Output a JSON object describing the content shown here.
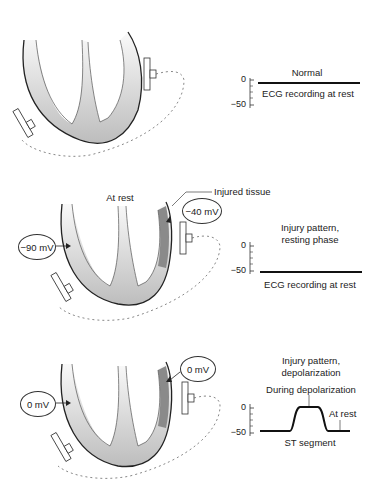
{
  "panels": [
    {
      "id": "normal",
      "heart_label": "",
      "ecg": {
        "title": "Normal",
        "caption": "ECG recording at rest",
        "axis_ticks": [
          "0",
          "−50"
        ],
        "trace": "flat-at-0"
      }
    },
    {
      "id": "injury-resting",
      "heart_label": "At rest",
      "injured_label": "Injured tissue",
      "left_potential": "−90 mV",
      "right_potential": "−40 mV",
      "ecg": {
        "title_line1": "Injury pattern,",
        "title_line2": "resting phase",
        "caption": "ECG recording at rest",
        "axis_ticks": [
          "0",
          "−50"
        ],
        "trace": "flat-at-minus-50"
      }
    },
    {
      "id": "injury-depolarization",
      "left_potential": "0 mV",
      "right_potential": "0 mV",
      "ecg": {
        "title_line1": "Injury pattern,",
        "title_line2": "depolarization",
        "annotation_top": "During depolarization",
        "annotation_right": "At rest",
        "caption": "ST segment",
        "axis_ticks": [
          "0",
          "−50"
        ],
        "trace": "elevated-plateau"
      }
    }
  ],
  "colors": {
    "myocardium_light": "#e6e6e6",
    "myocardium_mid": "#c4c4c4",
    "injured": "#8a8a8a",
    "outline": "#222222"
  }
}
